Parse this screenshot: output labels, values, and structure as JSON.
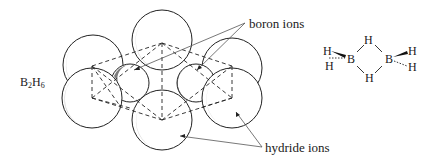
{
  "diagram": {
    "formula": {
      "b": "B",
      "b_sub": "2",
      "h": "H",
      "h_sub": "6"
    },
    "labels": {
      "boron_ions": "boron ions",
      "hydride_ions": "hydride ions"
    },
    "structural_formula": {
      "atoms": [
        "H",
        "H",
        "B",
        "H",
        "H",
        "B",
        "H",
        "H"
      ],
      "terminal_left_top": "H",
      "terminal_left_bottom": "H",
      "boron_left": "B",
      "bridge_top": "H",
      "bridge_bottom": "H",
      "boron_right": "B",
      "terminal_right_top": "H",
      "terminal_right_bottom": "H"
    },
    "colors": {
      "line": "#222222",
      "shade": "#9a9a9a",
      "background": "#ffffff"
    }
  }
}
